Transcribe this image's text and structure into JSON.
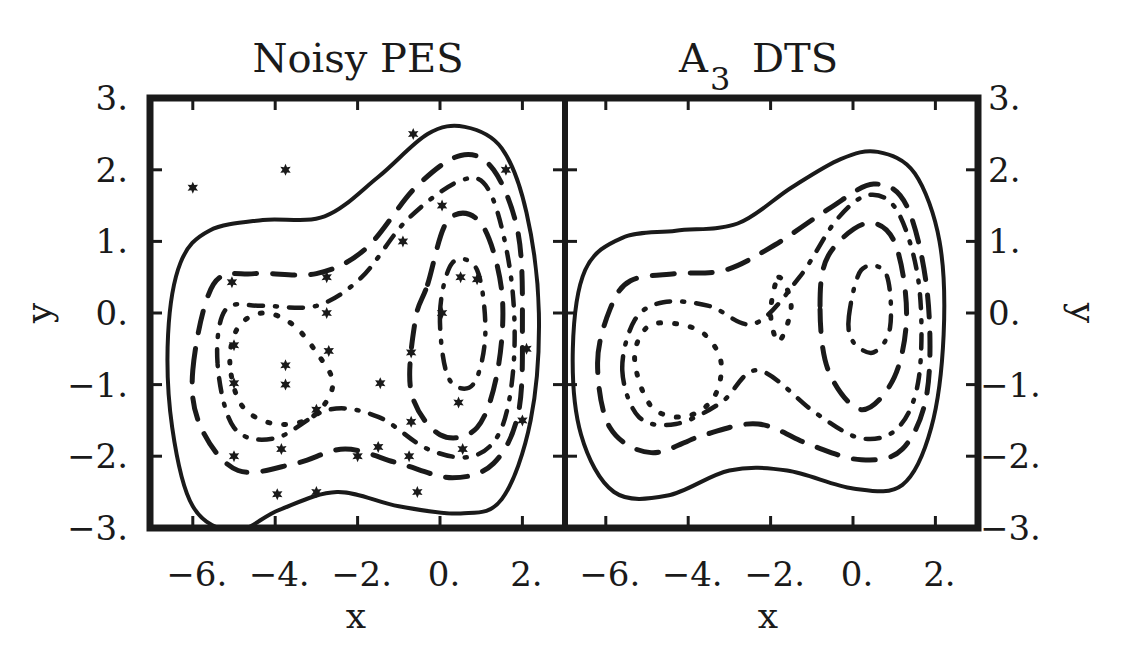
{
  "chart_data": [
    {
      "type": "contour",
      "title": "Noisy PES",
      "xlabel": "x",
      "ylabel": "y",
      "xticks": [
        "-6.",
        "-4.",
        "-2.",
        "0.",
        "2."
      ],
      "xtick_values": [
        -6,
        -4,
        -2,
        0,
        2
      ],
      "yticks": [
        "3.",
        "2.",
        "1.",
        "0.",
        "-1.",
        "-2.",
        "-3."
      ],
      "ytick_values": [
        3,
        2,
        1,
        0,
        -1,
        -2,
        -3
      ],
      "xlim": [
        -7.05,
        3.05
      ],
      "ylim": [
        -3,
        3
      ],
      "ylabel_side": "left",
      "grid": false,
      "contour_levels": [
        {
          "style": "solid",
          "description": "outermost level"
        },
        {
          "style": "long-dash",
          "description": "level 2"
        },
        {
          "style": "dash-dot",
          "description": "level 3"
        },
        {
          "style": "dotted",
          "description": "level 4 (innermost around minima)"
        }
      ],
      "minima": [
        {
          "x": -4.3,
          "y": -0.7
        },
        {
          "x": 0.5,
          "y": 0.0
        }
      ],
      "scatter_marker": "star",
      "scatter_points": [
        [
          -6.0,
          1.75
        ],
        [
          -3.75,
          2.0
        ],
        [
          -0.65,
          2.5
        ],
        [
          1.6,
          2.0
        ],
        [
          0.05,
          1.5
        ],
        [
          -0.9,
          1.0
        ],
        [
          -2.75,
          0.5
        ],
        [
          0.5,
          0.5
        ],
        [
          0.9,
          0.47
        ],
        [
          -5.05,
          0.43
        ],
        [
          -2.75,
          0.0
        ],
        [
          0.05,
          0.0
        ],
        [
          -5.0,
          -0.45
        ],
        [
          -2.7,
          -0.53
        ],
        [
          -0.7,
          -0.55
        ],
        [
          2.1,
          -0.5
        ],
        [
          -3.75,
          -0.73
        ],
        [
          -1.45,
          -0.98
        ],
        [
          -5.0,
          -0.98
        ],
        [
          -3.75,
          -1.0
        ],
        [
          -3.0,
          -1.35
        ],
        [
          -0.7,
          -1.52
        ],
        [
          2.0,
          -1.5
        ],
        [
          0.45,
          -1.25
        ],
        [
          -3.85,
          -1.9
        ],
        [
          -5.0,
          -2.0
        ],
        [
          -1.5,
          -1.87
        ],
        [
          -2.0,
          -2.0
        ],
        [
          0.55,
          -1.9
        ],
        [
          -0.75,
          -2.0
        ],
        [
          -3.95,
          -2.53
        ],
        [
          -3.0,
          -2.5
        ],
        [
          -0.55,
          -2.5
        ]
      ]
    },
    {
      "type": "contour",
      "title": "A3 DTS",
      "title_main": "A",
      "title_sub": "3",
      "title_rest": " DTS",
      "xlabel": "x",
      "ylabel": "y",
      "xticks": [
        "-6.",
        "-4.",
        "-2.",
        "0.",
        "2."
      ],
      "xtick_values": [
        -6,
        -4,
        -2,
        0,
        2
      ],
      "yticks": [
        "3.",
        "2.",
        "1.",
        "0.",
        "-1.",
        "-2.",
        "-3."
      ],
      "ytick_values": [
        3,
        2,
        1,
        0,
        -1,
        -2,
        -3
      ],
      "xlim": [
        -7.05,
        3.05
      ],
      "ylim": [
        -3,
        3
      ],
      "ylabel_side": "right",
      "grid": false,
      "contour_levels": [
        {
          "style": "solid",
          "description": "outermost level"
        },
        {
          "style": "long-dash",
          "description": "level 2"
        },
        {
          "style": "dash-dot",
          "description": "level 3"
        },
        {
          "style": "dotted",
          "description": "level 4 (innermost around minima)"
        }
      ],
      "minima": [
        {
          "x": -4.4,
          "y": -0.7
        },
        {
          "x": 0.3,
          "y": 0.0
        }
      ],
      "scatter_points": []
    }
  ],
  "panels": {
    "left": {
      "title": "Noisy PES",
      "xlabel": "x",
      "ylabel": "y"
    },
    "right": {
      "title_main": "A",
      "title_sub": "3",
      "title_rest": "DTS",
      "xlabel": "x",
      "ylabel": "y"
    }
  },
  "colors": {
    "ink": "#1a1a1a",
    "background": "#ffffff"
  }
}
